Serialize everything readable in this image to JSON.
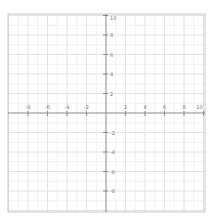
{
  "chart_data": {
    "type": "scatter",
    "title": "",
    "xlabel": "",
    "ylabel": "",
    "xlim": [
      -10,
      10
    ],
    "ylim": [
      -10,
      10
    ],
    "grid": true,
    "minor_grid_step": 1,
    "major_grid_step": 2,
    "x_tick_labels": [
      "-8",
      "-6",
      "-4",
      "-2",
      "2",
      "4",
      "6",
      "8",
      "10"
    ],
    "y_tick_labels": [
      "10",
      "8",
      "6",
      "4",
      "2",
      "-2",
      "-4",
      "-6",
      "-8"
    ],
    "series": []
  },
  "colors": {
    "background": "#ffffff",
    "border": "#c8c8c8",
    "axis": "#8a8a8a",
    "grid_major": "#e2e2e2",
    "grid_minor": "#f0f0f0",
    "label": "#777777"
  }
}
